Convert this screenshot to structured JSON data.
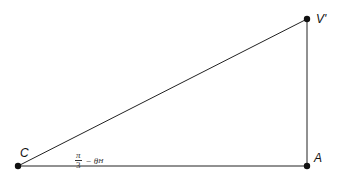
{
  "diagram": {
    "type": "right-triangle",
    "points": {
      "C": {
        "label": "C",
        "x": 18,
        "y": 166
      },
      "V": {
        "label": "V'",
        "x": 307,
        "y": 19
      },
      "A": {
        "label": "A",
        "x": 307,
        "y": 166
      }
    },
    "angle_label": {
      "vertex": "C",
      "numerator": "π",
      "denominator": "3",
      "rest": "− θ",
      "subscript": "H"
    },
    "line_color": "#222222",
    "dot_color": "#111111"
  }
}
